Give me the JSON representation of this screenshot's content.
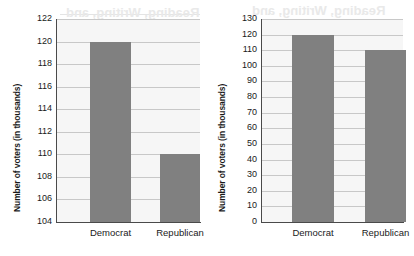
{
  "page": {
    "showthrough": {
      "line_a": "Reading, Writing, and",
      "line_b": "Reading, Writing, and",
      "line_c": "Mathematics",
      "body_1": "the 2007 election",
      "body_2": "voters that cast their",
      "body_3": "by one candidate in the",
      "body_4": "and they turned out to",
      "body_5": "showed the candidate",
      "body_6": "margin of victory was"
    }
  },
  "chart_data": [
    {
      "id": "left",
      "type": "bar",
      "title": "",
      "xlabel": "",
      "ylabel": "Number of voters (in thousands)",
      "categories": [
        "Democrat",
        "Republican"
      ],
      "values": [
        120,
        110
      ],
      "ylim": [
        104,
        122
      ],
      "yticks": [
        104,
        106,
        108,
        110,
        112,
        114,
        116,
        118,
        120,
        122
      ],
      "grid": true,
      "legend": "none",
      "bar_color": "#808080",
      "plot_bg": "#f6f6f6"
    },
    {
      "id": "right",
      "type": "bar",
      "title": "",
      "xlabel": "",
      "ylabel": "Number of voters (in thousands)",
      "categories": [
        "Democrat",
        "Republican"
      ],
      "values": [
        120,
        110
      ],
      "ylim": [
        0,
        130
      ],
      "yticks": [
        0,
        10,
        20,
        30,
        40,
        50,
        60,
        70,
        80,
        90,
        100,
        110,
        120,
        130
      ],
      "grid": true,
      "legend": "none",
      "bar_color": "#808080",
      "plot_bg": "#f6f6f6"
    }
  ]
}
